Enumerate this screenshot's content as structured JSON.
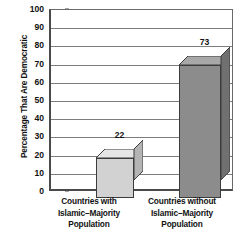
{
  "chart_data": {
    "type": "bar",
    "title": "",
    "subtitle": "",
    "xlabel": "",
    "ylabel": "Percentage That Are Democratic",
    "categories": [
      "Countries with\nIslamic–Majority\nPopulation",
      "Countries without\nIslamic–Majority\nPopulation"
    ],
    "category_lines": [
      [
        "Countries with",
        "Islamic–Majority",
        "Population"
      ],
      [
        "Countries without",
        "Islamic–Majority",
        "Population"
      ]
    ],
    "values": [
      22,
      73
    ],
    "value_labels": [
      "22",
      "73"
    ],
    "ylim": [
      0,
      100
    ],
    "ytick_step": 10,
    "ytick_labels": [
      "100",
      "90",
      "80",
      "70",
      "60",
      "50",
      "40",
      "30",
      "20",
      "10",
      "0"
    ],
    "grid": true,
    "grid_axis": "y",
    "legend": "none",
    "style": "3d-column",
    "bar_colors": [
      "#d2d2d2",
      "#8c8c8c"
    ],
    "bar_top_colors": [
      "#e6e6e6",
      "#a8a8a8"
    ],
    "bar_side_colors": [
      "#b4b4b4",
      "#707070"
    ],
    "bar_edge_color": "#3c3c3c",
    "axis_color": "#4a4a4a",
    "grid_color": "#7d7d7d",
    "background_color": "#ffffff",
    "text_color": "#111111"
  }
}
